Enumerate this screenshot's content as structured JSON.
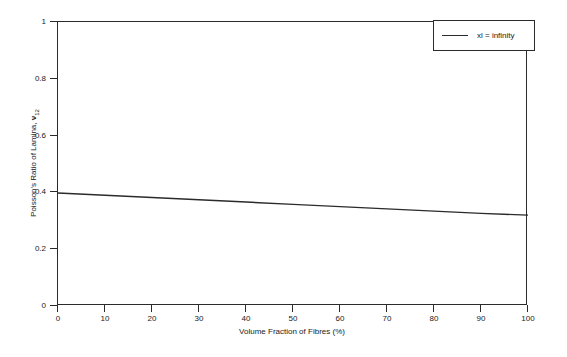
{
  "chart_data": {
    "type": "line",
    "title": "",
    "xlabel": "Volume Fraction of Fibres (%)",
    "ylabel": "Poisson's Ratio of Lamina, ν12",
    "ylabel_parts": {
      "prefix": "Poisson's Ratio of Lamina, ",
      "symbol": "ν",
      "subscript": "12"
    },
    "xlim": [
      0,
      100
    ],
    "ylim": [
      0,
      1
    ],
    "xticks": [
      "0",
      "10",
      "20",
      "30",
      "40",
      "50",
      "60",
      "70",
      "80",
      "90",
      "100"
    ],
    "xtick_values": [
      0,
      10,
      20,
      30,
      40,
      50,
      60,
      70,
      80,
      90,
      100
    ],
    "yticks": [
      "0",
      "0.2",
      "0.4",
      "0.6",
      "0.8",
      "1"
    ],
    "ytick_values": [
      0,
      0.2,
      0.4,
      0.6,
      0.8,
      1
    ],
    "grid": false,
    "legend_position": "top-right",
    "series": [
      {
        "name": "xl = infinity",
        "x": [
          0,
          10,
          20,
          30,
          40,
          50,
          60,
          70,
          80,
          90,
          100
        ],
        "values": [
          0.398,
          0.39,
          0.382,
          0.374,
          0.366,
          0.358,
          0.35,
          0.342,
          0.334,
          0.326,
          0.32
        ],
        "color": "#2b2b2b",
        "line_width": 1.4
      }
    ]
  },
  "legend": {
    "entries": [
      {
        "label": "xl = infinity",
        "color": "#2b2b2b"
      }
    ]
  },
  "axes": {
    "frame_color": "#2b2b2b"
  }
}
